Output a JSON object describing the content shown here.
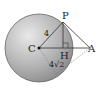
{
  "figure": {
    "type": "sphere-tangent-geometry",
    "sphere": {
      "center_label": "C",
      "fill_light": "#e6e6e6",
      "fill_dark": "#8c8c8c",
      "stroke": "#555555"
    },
    "points": {
      "C": "C",
      "P": "P",
      "H": "H",
      "A": "A"
    },
    "lengths": {
      "CP": "4",
      "CA_lower": "4√2"
    },
    "colors": {
      "line": "#333333",
      "dashed": "#777777"
    }
  }
}
